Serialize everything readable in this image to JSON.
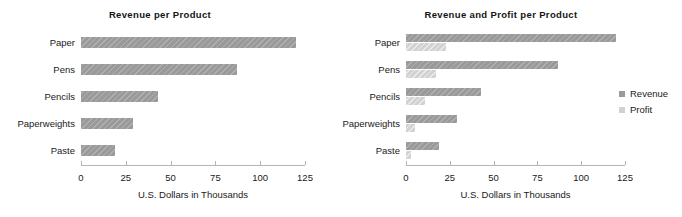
{
  "chart_data": [
    {
      "id": "revenue-per-product",
      "type": "bar",
      "orientation": "horizontal",
      "title": "Revenue per Product",
      "xlabel": "U.S. Dollars in Thousands",
      "ylabel": "",
      "categories": [
        "Paper",
        "Pens",
        "Pencils",
        "Paperweights",
        "Paste"
      ],
      "series": [
        {
          "name": "Revenue",
          "values": [
            120,
            87,
            43,
            29,
            19
          ],
          "color": "#9a9a9a"
        }
      ],
      "xlim": [
        0,
        125
      ],
      "xticks": [
        0,
        25,
        50,
        75,
        100,
        125
      ],
      "xticklabels": [
        "0",
        "25",
        "50",
        "75",
        "100",
        "125"
      ],
      "grid": false,
      "legend": false
    },
    {
      "id": "revenue-and-profit-per-product",
      "type": "bar",
      "orientation": "horizontal",
      "title": "Revenue and Profit per Product",
      "xlabel": "U.S. Dollars in Thousands",
      "ylabel": "",
      "categories": [
        "Paper",
        "Pens",
        "Pencils",
        "Paperweights",
        "Paste"
      ],
      "series": [
        {
          "name": "Revenue",
          "values": [
            120,
            87,
            43,
            29,
            19
          ],
          "color": "#9a9a9a"
        },
        {
          "name": "Profit",
          "values": [
            23,
            17,
            11,
            5,
            3
          ],
          "color": "#d2d2d2"
        }
      ],
      "xlim": [
        0,
        125
      ],
      "xticks": [
        0,
        25,
        50,
        75,
        100,
        125
      ],
      "xticklabels": [
        "0",
        "25",
        "50",
        "75",
        "100",
        "125"
      ],
      "grid": false,
      "legend": true,
      "legend_position": "right",
      "legend_entries": [
        "Revenue",
        "Profit"
      ]
    }
  ]
}
